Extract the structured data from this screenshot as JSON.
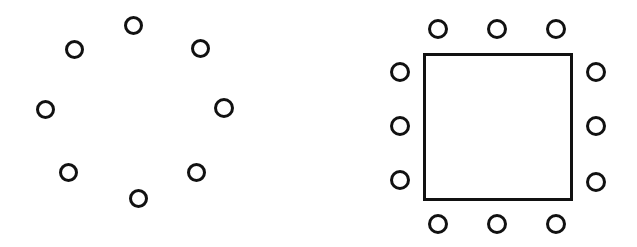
{
  "figure": {
    "background_color": "#ffffff",
    "stroke_color": "#111111",
    "canvas": {
      "width": 637,
      "height": 247
    }
  },
  "left_figure": {
    "name": "circular-ring-arrangement",
    "description": "Eight open circles arranged evenly around an invisible ring",
    "circle_count": 8,
    "circle_diameter": 19,
    "circle_stroke_width": 3,
    "ring_center": {
      "x": 135,
      "y": 111
    },
    "ring_radius": 87,
    "circles": [
      {
        "label": "top",
        "x": 133,
        "y": 25,
        "d": 19
      },
      {
        "label": "upper-right",
        "x": 200,
        "y": 48,
        "d": 19
      },
      {
        "label": "right",
        "x": 224,
        "y": 108,
        "d": 20
      },
      {
        "label": "lower-right",
        "x": 196,
        "y": 172,
        "d": 19
      },
      {
        "label": "bottom",
        "x": 138,
        "y": 198,
        "d": 19
      },
      {
        "label": "lower-left",
        "x": 68,
        "y": 172,
        "d": 19
      },
      {
        "label": "left",
        "x": 45,
        "y": 109,
        "d": 19
      },
      {
        "label": "upper-left",
        "x": 74,
        "y": 49,
        "d": 19
      }
    ]
  },
  "right_figure": {
    "name": "square-border-arrangement",
    "description": "A square outline surrounded by twelve open circles, three per side",
    "circle_count": 12,
    "circle_diameter": 20,
    "circle_stroke_width": 3,
    "square": {
      "x": 423,
      "y": 53,
      "width": 150,
      "height": 148,
      "stroke_width": 3
    },
    "circles": [
      {
        "label": "top-left",
        "x": 438,
        "y": 29,
        "d": 20
      },
      {
        "label": "top-center",
        "x": 497,
        "y": 29,
        "d": 20
      },
      {
        "label": "top-right",
        "x": 556,
        "y": 29,
        "d": 20
      },
      {
        "label": "right-top",
        "x": 596,
        "y": 72,
        "d": 20
      },
      {
        "label": "right-middle",
        "x": 596,
        "y": 126,
        "d": 20
      },
      {
        "label": "right-bottom",
        "x": 596,
        "y": 182,
        "d": 20
      },
      {
        "label": "bottom-right",
        "x": 556,
        "y": 224,
        "d": 20
      },
      {
        "label": "bottom-center",
        "x": 497,
        "y": 224,
        "d": 20
      },
      {
        "label": "bottom-left",
        "x": 438,
        "y": 224,
        "d": 20
      },
      {
        "label": "left-bottom",
        "x": 400,
        "y": 180,
        "d": 20
      },
      {
        "label": "left-middle",
        "x": 400,
        "y": 126,
        "d": 20
      },
      {
        "label": "left-top",
        "x": 400,
        "y": 72,
        "d": 20
      }
    ]
  }
}
